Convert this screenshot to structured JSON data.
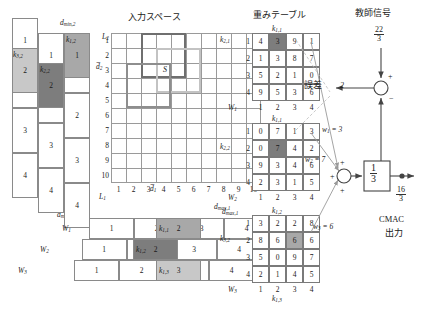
{
  "titles": {
    "input_space": "入力スペース",
    "weight_table": "重みテーブル",
    "teacher_signal": "教師信号",
    "error": "誤差",
    "cmac": "CMAC",
    "cmac_output_label": "出力"
  },
  "axes": {
    "d_min_2": "dmin,2",
    "d_max_2": "dmax,2",
    "d_min_1": "dmin,1",
    "d_max_1": "dmax,1",
    "L1": "L1",
    "L2": "L2",
    "d1": "d1",
    "d2": "d2",
    "s_marker": "S",
    "x_ticks": [
      "1",
      "2",
      "3",
      "4",
      "5",
      "6",
      "7",
      "8",
      "9",
      "10"
    ],
    "y_ticks": [
      "1",
      "2",
      "3",
      "4",
      "5",
      "6",
      "7",
      "8",
      "9",
      "10"
    ]
  },
  "offset_columns": {
    "k32": "k3,2",
    "k22": "k2,2",
    "k12": "k1,2",
    "col_k32": [
      "1",
      "2",
      "3",
      "4"
    ],
    "col_k22": [
      "1",
      "2",
      "3",
      "4"
    ],
    "col_k12": [
      "1",
      "2",
      "3",
      "4"
    ]
  },
  "offset_rows": {
    "W1": "W1",
    "W2": "W2",
    "W3": "W3",
    "k11": "k1,1",
    "k21": "k1,2",
    "k31": "k1,3",
    "row_W1": [
      "1",
      "2",
      "3",
      "4"
    ],
    "row_W2": [
      "1",
      "2",
      "3",
      "4"
    ],
    "row_W3": [
      "1",
      "2",
      "3",
      "4"
    ]
  },
  "weight_tables": [
    {
      "name": "W1",
      "row_label": "k2,1",
      "col_label": "k1,1",
      "w_label": "W1",
      "row_ticks": [
        "1",
        "2",
        "3",
        "4"
      ],
      "col_ticks": [
        "1",
        "2",
        "3",
        "4"
      ],
      "values": [
        [
          "4",
          "3",
          "9",
          "1"
        ],
        [
          "1",
          "3",
          "8",
          "7"
        ],
        [
          "5",
          "2",
          "1",
          "0"
        ],
        [
          "9",
          "5",
          "3",
          "6"
        ]
      ],
      "highlight": {
        "row": 0,
        "col": 1,
        "shade": "dark"
      }
    },
    {
      "name": "W2",
      "row_label": "k2,2",
      "col_label": "k1,1",
      "w_label": "W2",
      "row_ticks": [
        "1",
        "2",
        "3",
        "4"
      ],
      "col_ticks": [
        "1",
        "2",
        "3",
        "4"
      ],
      "values": [
        [
          "0",
          "7",
          "1",
          "3"
        ],
        [
          "0",
          "7",
          "4",
          "2"
        ],
        [
          "9",
          "3",
          "4",
          "6"
        ],
        [
          "2",
          "3",
          "1",
          "5"
        ]
      ],
      "highlight": {
        "row": 1,
        "col": 1,
        "shade": "dark"
      }
    },
    {
      "name": "W3",
      "row_label": "k3,2",
      "col_label": "k1,2",
      "col_label_bottom": "k1,3",
      "w_label": "W3",
      "row_ticks": [
        "1",
        "2",
        "3",
        "4"
      ],
      "col_ticks": [
        "1",
        "2",
        "3",
        "4"
      ],
      "values": [
        [
          "3",
          "2",
          "2",
          "8"
        ],
        [
          "8",
          "6",
          "6",
          "6"
        ],
        [
          "5",
          "0",
          "9",
          "7"
        ],
        [
          "2",
          "1",
          "4",
          "5"
        ]
      ],
      "highlight": {
        "row": 1,
        "col": 2,
        "shade": "mid"
      }
    }
  ],
  "signals": {
    "teacher_value_num": "22",
    "teacher_value_den": "3",
    "error_value": "2",
    "w1": "w1 = 3",
    "w2": "w2 = 7",
    "w3": "w3 = 6",
    "gain_num": "1",
    "gain_den": "3",
    "output_num": "16",
    "output_den": "3",
    "plus": "+",
    "minus": "−"
  },
  "colors": {
    "grid": "#9a9a9a",
    "rf_dark": "#6f6f6f",
    "rf_mid": "#8e8e8e",
    "rf_light": "#c3c3c3",
    "shade_dark": "#7d7d7d",
    "shade_mid": "#a8a8a8",
    "shade_light": "#c8c8c8"
  }
}
